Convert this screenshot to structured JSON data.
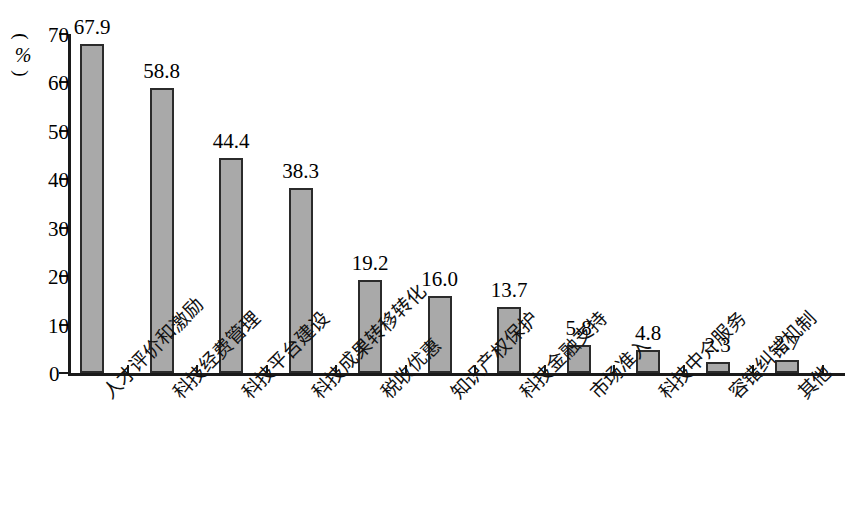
{
  "chart_data": {
    "type": "bar",
    "title": "",
    "subtitle": "",
    "xlabel": "",
    "ylabel": "(%)",
    "ylabel_parts": {
      "open": "(",
      "symbol": "%",
      "close": ")"
    },
    "ylim": [
      0,
      70
    ],
    "yticks": [
      0,
      10,
      20,
      30,
      40,
      50,
      60,
      70
    ],
    "ytick_labels": [
      "0",
      "10",
      "20",
      "30",
      "40",
      "50",
      "60",
      "70"
    ],
    "grid": false,
    "legend": false,
    "categories": [
      "人才评价和激励",
      "科技经费管理",
      "科技平台建设",
      "科技成果转移转化",
      "税收优惠",
      "知识产权保护",
      "科技金融支持",
      "市场准入",
      "科技中介服务",
      "容错纠错机制",
      "其他"
    ],
    "values": [
      67.9,
      58.8,
      44.4,
      38.3,
      19.2,
      16.0,
      13.7,
      5.8,
      4.8,
      2.3,
      2.7
    ],
    "value_labels": [
      "67.9",
      "58.8",
      "44.4",
      "38.3",
      "19.2",
      "16.0",
      "13.7",
      "5.8",
      "4.8",
      "2.3",
      "2.7"
    ],
    "bar_color": "#a9a9a9",
    "bar_edge_color": "#2b2b2b",
    "axis_color": "#1a1a1a",
    "background_color": "#ffffff"
  }
}
